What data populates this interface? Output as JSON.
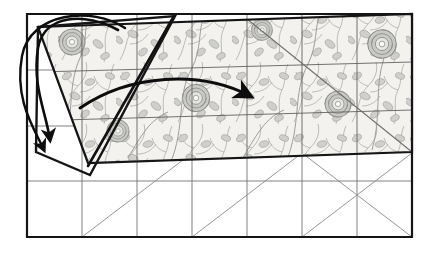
{
  "figure": {
    "caption": "",
    "kind": "instructional-line-drawing",
    "background_color": "#ffffff"
  },
  "colors": {
    "outline": "#1a1a1a",
    "grid_line": "#5e5e5e",
    "diagonal_line": "#6b6b6b",
    "fabric_fill": "#f3f2ef",
    "fabric_print": "#9a9a97",
    "fabric_print_light": "#c4c4c1",
    "arrow": "#0d0d0d",
    "plain_fill": "#ffffff"
  },
  "layout": {
    "base_rect": {
      "label": "base grid rectangle",
      "left": 27,
      "top": 14,
      "right": 412,
      "bottom": 237,
      "columns": 7,
      "rows": 4
    },
    "fabric_panel": {
      "label": "printed fabric overlay (upper band)",
      "rows_covered": 2,
      "top_left": [
        38,
        27
      ],
      "top_right": [
        412,
        14
      ],
      "bottom_right": [
        412,
        152
      ],
      "bottom_left": [
        88,
        163
      ]
    },
    "folded_flap": {
      "label": "folded-back corner flap",
      "vertices": [
        [
          38,
          27
        ],
        [
          175,
          16
        ],
        [
          90,
          175
        ],
        [
          36,
          152
        ]
      ]
    }
  },
  "annotations": {
    "curved_arrow_main": {
      "name": "fold-direction-arrow",
      "description": "large curved arrow sweeping right across the fabric",
      "start": [
        80,
        108
      ],
      "control": [
        165,
        72
      ],
      "end": [
        252,
        99
      ]
    },
    "loop_arrow_left": {
      "name": "fold-back-loop-arrow",
      "description": "arrow looping over the left edge back down to the base",
      "start": [
        118,
        30
      ],
      "end": [
        46,
        146
      ]
    },
    "flap_diagonal": {
      "name": "flap-fold-crease",
      "description": "heavy diagonal crease inside the flap",
      "start": [
        88,
        166
      ],
      "end": [
        174,
        16
      ]
    }
  },
  "grid": {
    "vertical_x": [
      27,
      82,
      137,
      192,
      247,
      302,
      357,
      412
    ],
    "horizontal_y": [
      14,
      70,
      126,
      181,
      237
    ],
    "diagonals": [
      {
        "name": "diag-upper-right-down",
        "from": [
          247,
          16
        ],
        "to": [
          412,
          152
        ]
      },
      {
        "name": "diag-lower-left-up",
        "from": [
          82,
          237
        ],
        "to": [
          192,
          152
        ]
      },
      {
        "name": "diag-lower-mid",
        "from": [
          192,
          237
        ],
        "to": [
          302,
          152
        ]
      },
      {
        "name": "diag-lower-right",
        "from": [
          302,
          237
        ],
        "to": [
          412,
          152
        ]
      },
      {
        "name": "diag-bottom-right-run",
        "from": [
          412,
          237
        ],
        "to": [
          302,
          152
        ]
      }
    ]
  },
  "motifs": {
    "flower_label": "rose-bloom",
    "leaf_label": "leaf-sprig",
    "flowers": [
      {
        "cx": 72,
        "cy": 42,
        "r": 14
      },
      {
        "cx": 196,
        "cy": 98,
        "r": 14
      },
      {
        "cx": 338,
        "cy": 104,
        "r": 14
      },
      {
        "cx": 382,
        "cy": 44,
        "r": 15
      },
      {
        "cx": 118,
        "cy": 131,
        "r": 12
      },
      {
        "cx": 262,
        "cy": 30,
        "r": 11
      }
    ]
  }
}
